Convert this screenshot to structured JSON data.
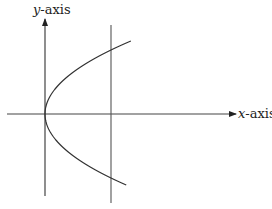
{
  "diagram": {
    "type": "parabola-axes",
    "y_axis_label": {
      "var": "y",
      "suffix": "-axis"
    },
    "x_axis_label": {
      "var": "x",
      "suffix": "-axis"
    },
    "curve": {
      "equation": "x = y^2",
      "vertex": [
        0,
        0
      ]
    },
    "vertical_line": {
      "equation": "x = c",
      "c": 1
    },
    "colors": {
      "ink": "#333333",
      "background": "#ffffff"
    }
  }
}
